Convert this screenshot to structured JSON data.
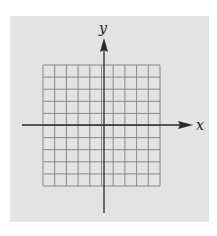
{
  "figure": {
    "type": "coordinate-grid",
    "axis_labels": {
      "x": "x",
      "y": "y"
    },
    "grid": {
      "columns": 10,
      "rows": 10
    },
    "colors": {
      "panel": "#e3e3e3",
      "grid_line": "#8a8a8a",
      "axis": "#2a2a2a",
      "background": "#ffffff"
    }
  }
}
